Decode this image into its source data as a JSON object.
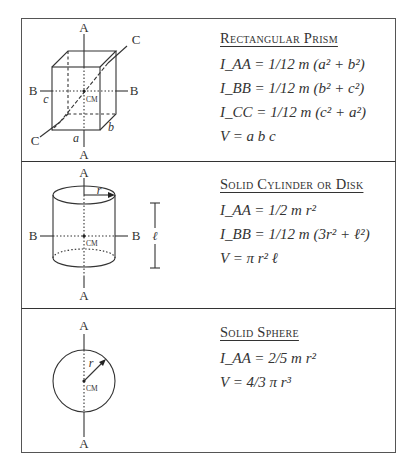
{
  "sections": [
    {
      "id": "rectangular-prism",
      "title": "Rectangular Prism",
      "formulas": [
        "I_AA = 1/12 m (a² + b²)",
        "I_BB = 1/12 m (b² + c²)",
        "I_CC = 1/12 m (c² + a²)",
        "V = a b c"
      ],
      "diagram": {
        "axis_labels": [
          "A",
          "A",
          "B",
          "B",
          "C",
          "C"
        ],
        "dimension_labels": [
          "a",
          "b",
          "c"
        ],
        "center_label": "CM"
      }
    },
    {
      "id": "solid-cylinder",
      "title": "Solid Cylinder or Disk",
      "formulas": [
        "I_AA = 1/2 m r²",
        "I_BB = 1/12 m (3r² + ℓ²)",
        "V = π r² ℓ"
      ],
      "diagram": {
        "axis_labels": [
          "A",
          "A",
          "B",
          "B"
        ],
        "dimension_labels": [
          "r",
          "ℓ"
        ],
        "center_label": "CM"
      }
    },
    {
      "id": "solid-sphere",
      "title": "Solid Sphere",
      "formulas": [
        "I_AA = 2/5 m r²",
        "V = 4/3 π r³"
      ],
      "diagram": {
        "axis_labels": [
          "A",
          "A"
        ],
        "dimension_labels": [
          "r"
        ],
        "center_label": "CM"
      }
    }
  ]
}
